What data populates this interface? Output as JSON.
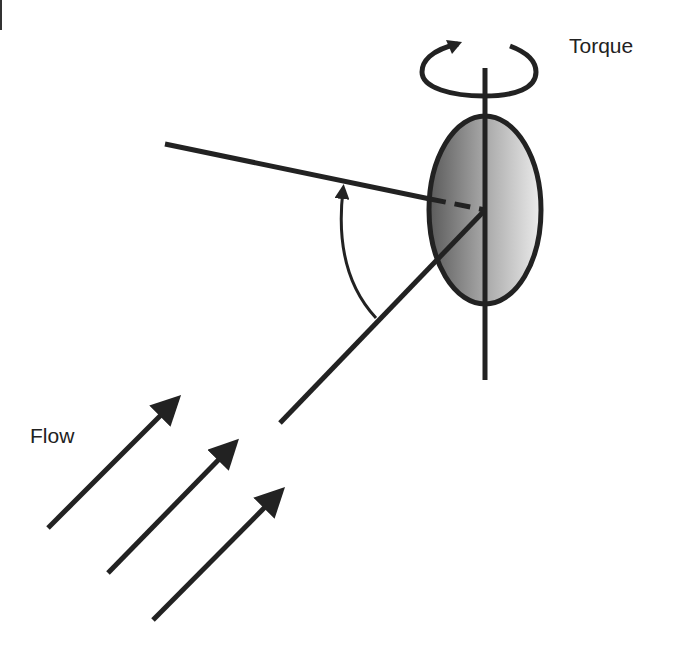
{
  "diagram": {
    "labels": {
      "torque": "Torque",
      "flow": "Flow",
      "angle": ""
    },
    "colors": {
      "stroke": "#222222",
      "ellipse_dark": "#5a5a5a",
      "ellipse_light": "#eeeeee",
      "background": "#ffffff"
    },
    "elements": [
      {
        "type": "rotation-arrow",
        "label": "Torque",
        "center": [
          485,
          68
        ]
      },
      {
        "type": "vertical-axis",
        "from": [
          485,
          68
        ],
        "to": [
          485,
          380
        ]
      },
      {
        "type": "ellipse",
        "center": [
          485,
          210
        ],
        "rx": 57,
        "ry": 95,
        "fill": "gradient dark-left to light-right"
      },
      {
        "type": "reference-line",
        "from": [
          165,
          144
        ],
        "to": [
          485,
          210
        ],
        "dashed_inside_ellipse": true
      },
      {
        "type": "flow-direction-line",
        "from": [
          280,
          423
        ],
        "to": [
          485,
          210
        ]
      },
      {
        "type": "angle-arc",
        "between": [
          "reference-line",
          "flow-direction-line"
        ],
        "label": "I"
      },
      {
        "type": "flow-arrow",
        "from": [
          48,
          528
        ],
        "to": [
          180,
          396
        ]
      },
      {
        "type": "flow-arrow",
        "from": [
          108,
          573
        ],
        "to": [
          238,
          440
        ]
      },
      {
        "type": "flow-arrow",
        "from": [
          153,
          620
        ],
        "to": [
          284,
          488
        ]
      }
    ]
  }
}
